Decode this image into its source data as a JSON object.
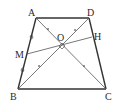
{
  "diagram": {
    "points": {
      "A": {
        "label": "A",
        "x": 36,
        "y": 18
      },
      "D": {
        "label": "D",
        "x": 89,
        "y": 18
      },
      "B": {
        "label": "B",
        "x": 18,
        "y": 89
      },
      "C": {
        "label": "C",
        "x": 106,
        "y": 89
      },
      "O": {
        "label": "O",
        "x": 62,
        "y": 43
      },
      "M": {
        "label": "M",
        "x": 27,
        "y": 54
      },
      "H": {
        "label": "H",
        "x": 92,
        "y": 37
      }
    },
    "segments": [
      "AD",
      "BC",
      "AB",
      "DC",
      "AC",
      "BD",
      "MH"
    ],
    "annotations": {
      "right_angle_at": "O",
      "equal_marks_AB": "circle",
      "equal_marks_diagonals": "x"
    },
    "colors": {
      "line": "#333333",
      "thin_line": "#555555",
      "background": "#ffffff"
    }
  }
}
